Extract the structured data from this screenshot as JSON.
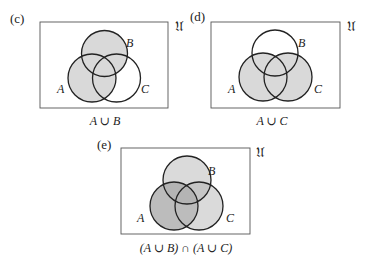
{
  "universe_symbol": "𝔘",
  "colors": {
    "light": "#d9d9d9",
    "dark": "#bdbdbd",
    "stroke": "#222222",
    "frame": "#555555"
  },
  "panels": [
    {
      "tag": "(c)",
      "caption": "A ∪ B",
      "labels": {
        "A": "A",
        "B": "B",
        "C": "C"
      },
      "shaded": "A ∪ B"
    },
    {
      "tag": "(d)",
      "caption": "A ∪ C",
      "labels": {
        "A": "A",
        "B": "B",
        "C": "C"
      },
      "shaded": "A ∪ C"
    },
    {
      "tag": "(e)",
      "caption": "(A ∪ B) ∩ (A ∪ C)",
      "labels": {
        "A": "A",
        "B": "B",
        "C": "C"
      },
      "shaded": "A (dark) and B ∪ C (light)"
    }
  ]
}
